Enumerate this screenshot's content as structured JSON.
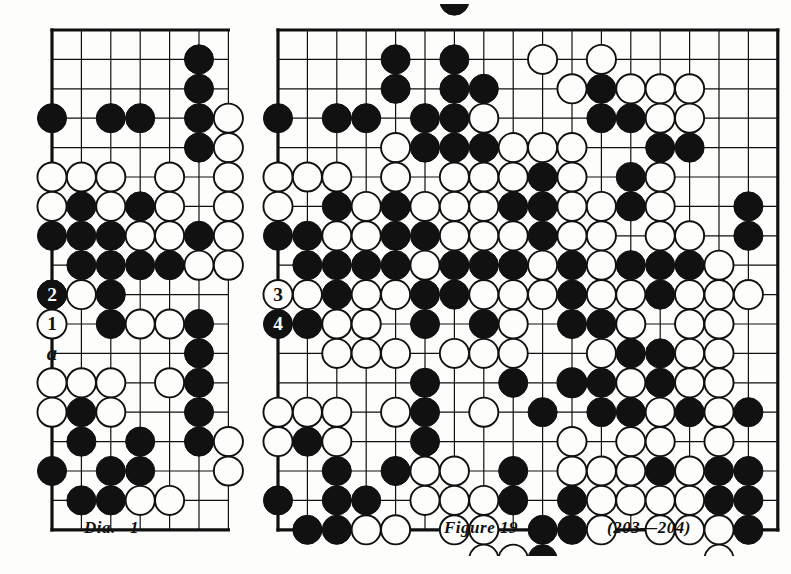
{
  "page": {
    "background_color": "#fdfdfb",
    "ink_color": "#101010",
    "stone_black_color": "#111111",
    "stone_white_color": "#fdfdfb"
  },
  "left_diagram": {
    "caption": "Dia.   1",
    "board": {
      "cols": 6,
      "rows": 17,
      "cell": 29.4,
      "origin_x": 52,
      "origin_y": 30,
      "cropped_right": true,
      "edge_sides": [
        "left",
        "top",
        "bottom"
      ]
    },
    "markers": [
      {
        "name": "move-1-white",
        "label": "1",
        "color": "white",
        "col": 0,
        "row": 10
      },
      {
        "name": "move-2-black",
        "label": "2",
        "color": "black",
        "col": 0,
        "row": 9
      },
      {
        "name": "point-label-b",
        "label": "b",
        "col": 2,
        "row": 10
      },
      {
        "name": "point-label-a",
        "label": "a",
        "col": 0,
        "row": 11
      }
    ],
    "black_stones": [
      [
        5,
        1
      ],
      [
        5,
        2
      ],
      [
        0,
        3
      ],
      [
        2,
        3
      ],
      [
        3,
        3
      ],
      [
        5,
        3
      ],
      [
        5,
        4
      ],
      [
        1,
        6
      ],
      [
        3,
        6
      ],
      [
        0,
        7
      ],
      [
        1,
        7
      ],
      [
        2,
        7
      ],
      [
        5,
        7
      ],
      [
        1,
        8
      ],
      [
        2,
        8
      ],
      [
        3,
        8
      ],
      [
        4,
        8
      ],
      [
        0,
        9
      ],
      [
        2,
        9
      ],
      [
        2,
        10
      ],
      [
        5,
        10
      ],
      [
        5,
        11
      ],
      [
        5,
        12
      ],
      [
        1,
        13
      ],
      [
        5,
        13
      ],
      [
        1,
        14
      ],
      [
        3,
        14
      ],
      [
        5,
        14
      ],
      [
        0,
        15
      ],
      [
        2,
        15
      ],
      [
        3,
        15
      ],
      [
        1,
        16
      ],
      [
        2,
        16
      ]
    ],
    "white_stones": [
      [
        6,
        3
      ],
      [
        6,
        4
      ],
      [
        0,
        5
      ],
      [
        1,
        5
      ],
      [
        2,
        5
      ],
      [
        4,
        5
      ],
      [
        6,
        5
      ],
      [
        0,
        6
      ],
      [
        2,
        6
      ],
      [
        4,
        6
      ],
      [
        6,
        6
      ],
      [
        3,
        7
      ],
      [
        4,
        7
      ],
      [
        6,
        7
      ],
      [
        5,
        8
      ],
      [
        6,
        8
      ],
      [
        1,
        9
      ],
      [
        3,
        10
      ],
      [
        4,
        10
      ],
      [
        0,
        12
      ],
      [
        1,
        12
      ],
      [
        2,
        12
      ],
      [
        4,
        12
      ],
      [
        0,
        13
      ],
      [
        2,
        13
      ],
      [
        6,
        14
      ],
      [
        6,
        15
      ],
      [
        3,
        16
      ],
      [
        4,
        16
      ]
    ]
  },
  "right_diagram": {
    "caption": "Figure 19",
    "move_range": "(203—204)",
    "board": {
      "cols": 17,
      "rows": 17,
      "cell": 29.4,
      "origin_x": 278,
      "origin_y": 30,
      "edge_sides": [
        "left",
        "top",
        "right",
        "bottom"
      ]
    },
    "markers": [
      {
        "name": "move-3-white",
        "label": "3",
        "color": "white",
        "col": 0,
        "row": 9
      },
      {
        "name": "move-4-black",
        "label": "4",
        "color": "black",
        "col": 0,
        "row": 10
      },
      {
        "name": "point-label-c",
        "label": "C",
        "col": 1,
        "row": 10
      }
    ],
    "black_stones": [
      [
        6,
        -1
      ],
      [
        4,
        1
      ],
      [
        6,
        1
      ],
      [
        4,
        2
      ],
      [
        6,
        2
      ],
      [
        7,
        2
      ],
      [
        11,
        2
      ],
      [
        0,
        3
      ],
      [
        2,
        3
      ],
      [
        3,
        3
      ],
      [
        5,
        3
      ],
      [
        6,
        3
      ],
      [
        11,
        3
      ],
      [
        12,
        3
      ],
      [
        5,
        4
      ],
      [
        6,
        4
      ],
      [
        7,
        4
      ],
      [
        13,
        4
      ],
      [
        14,
        4
      ],
      [
        9,
        5
      ],
      [
        12,
        5
      ],
      [
        2,
        6
      ],
      [
        4,
        6
      ],
      [
        8,
        6
      ],
      [
        9,
        6
      ],
      [
        12,
        6
      ],
      [
        16,
        6
      ],
      [
        0,
        7
      ],
      [
        1,
        7
      ],
      [
        4,
        7
      ],
      [
        5,
        7
      ],
      [
        9,
        7
      ],
      [
        16,
        7
      ],
      [
        1,
        8
      ],
      [
        2,
        8
      ],
      [
        3,
        8
      ],
      [
        4,
        8
      ],
      [
        6,
        8
      ],
      [
        7,
        8
      ],
      [
        8,
        8
      ],
      [
        10,
        8
      ],
      [
        12,
        8
      ],
      [
        13,
        8
      ],
      [
        14,
        8
      ],
      [
        0,
        9
      ],
      [
        2,
        9
      ],
      [
        5,
        9
      ],
      [
        6,
        9
      ],
      [
        10,
        9
      ],
      [
        13,
        9
      ],
      [
        1,
        10
      ],
      [
        5,
        10
      ],
      [
        7,
        10
      ],
      [
        10,
        10
      ],
      [
        11,
        10
      ],
      [
        12,
        11
      ],
      [
        13,
        11
      ],
      [
        5,
        12
      ],
      [
        8,
        12
      ],
      [
        10,
        12
      ],
      [
        11,
        12
      ],
      [
        13,
        12
      ],
      [
        5,
        13
      ],
      [
        9,
        13
      ],
      [
        11,
        13
      ],
      [
        12,
        13
      ],
      [
        14,
        13
      ],
      [
        16,
        13
      ],
      [
        1,
        14
      ],
      [
        5,
        14
      ],
      [
        2,
        15
      ],
      [
        4,
        15
      ],
      [
        8,
        15
      ],
      [
        13,
        15
      ],
      [
        15,
        15
      ],
      [
        16,
        15
      ],
      [
        0,
        16
      ],
      [
        2,
        16
      ],
      [
        3,
        16
      ],
      [
        8,
        16
      ],
      [
        10,
        16
      ],
      [
        15,
        16
      ],
      [
        16,
        16
      ],
      [
        1,
        17
      ],
      [
        2,
        17
      ],
      [
        9,
        17
      ],
      [
        10,
        17
      ],
      [
        16,
        17
      ],
      [
        9,
        18
      ]
    ],
    "white_stones": [
      [
        9,
        1
      ],
      [
        11,
        1
      ],
      [
        10,
        2
      ],
      [
        12,
        2
      ],
      [
        13,
        2
      ],
      [
        14,
        2
      ],
      [
        7,
        3
      ],
      [
        13,
        3
      ],
      [
        14,
        3
      ],
      [
        4,
        4
      ],
      [
        8,
        4
      ],
      [
        9,
        4
      ],
      [
        10,
        4
      ],
      [
        0,
        5
      ],
      [
        1,
        5
      ],
      [
        2,
        5
      ],
      [
        4,
        5
      ],
      [
        6,
        5
      ],
      [
        7,
        5
      ],
      [
        8,
        5
      ],
      [
        10,
        5
      ],
      [
        13,
        5
      ],
      [
        0,
        6
      ],
      [
        3,
        6
      ],
      [
        5,
        6
      ],
      [
        6,
        6
      ],
      [
        7,
        6
      ],
      [
        10,
        6
      ],
      [
        11,
        6
      ],
      [
        13,
        6
      ],
      [
        2,
        7
      ],
      [
        3,
        7
      ],
      [
        6,
        7
      ],
      [
        7,
        7
      ],
      [
        8,
        7
      ],
      [
        10,
        7
      ],
      [
        11,
        7
      ],
      [
        13,
        7
      ],
      [
        14,
        7
      ],
      [
        5,
        8
      ],
      [
        9,
        8
      ],
      [
        11,
        8
      ],
      [
        15,
        8
      ],
      [
        1,
        9
      ],
      [
        3,
        9
      ],
      [
        4,
        9
      ],
      [
        7,
        9
      ],
      [
        8,
        9
      ],
      [
        9,
        9
      ],
      [
        11,
        9
      ],
      [
        12,
        9
      ],
      [
        14,
        9
      ],
      [
        15,
        9
      ],
      [
        16,
        9
      ],
      [
        2,
        10
      ],
      [
        3,
        10
      ],
      [
        8,
        10
      ],
      [
        12,
        10
      ],
      [
        14,
        10
      ],
      [
        15,
        10
      ],
      [
        2,
        11
      ],
      [
        3,
        11
      ],
      [
        4,
        11
      ],
      [
        6,
        11
      ],
      [
        7,
        11
      ],
      [
        8,
        11
      ],
      [
        11,
        11
      ],
      [
        14,
        11
      ],
      [
        15,
        11
      ],
      [
        10,
        12
      ],
      [
        12,
        12
      ],
      [
        14,
        12
      ],
      [
        15,
        12
      ],
      [
        0,
        13
      ],
      [
        1,
        13
      ],
      [
        2,
        13
      ],
      [
        4,
        13
      ],
      [
        7,
        13
      ],
      [
        13,
        13
      ],
      [
        15,
        13
      ],
      [
        0,
        14
      ],
      [
        2,
        14
      ],
      [
        10,
        14
      ],
      [
        12,
        14
      ],
      [
        13,
        14
      ],
      [
        15,
        14
      ],
      [
        5,
        15
      ],
      [
        6,
        15
      ],
      [
        10,
        15
      ],
      [
        11,
        15
      ],
      [
        12,
        15
      ],
      [
        14,
        15
      ],
      [
        5,
        16
      ],
      [
        6,
        16
      ],
      [
        7,
        16
      ],
      [
        11,
        16
      ],
      [
        12,
        16
      ],
      [
        13,
        16
      ],
      [
        14,
        16
      ],
      [
        3,
        17
      ],
      [
        4,
        17
      ],
      [
        6,
        17
      ],
      [
        7,
        17
      ],
      [
        11,
        17
      ],
      [
        13,
        17
      ],
      [
        14,
        17
      ],
      [
        15,
        17
      ],
      [
        7,
        18
      ],
      [
        8,
        18
      ],
      [
        15,
        18
      ]
    ]
  }
}
